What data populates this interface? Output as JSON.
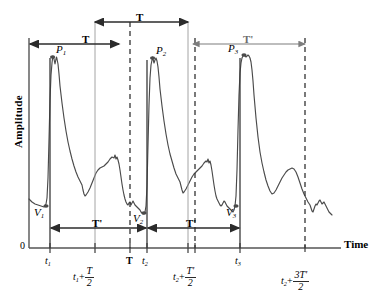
{
  "figure": {
    "type": "waveform-annotated-plot",
    "background": "#ffffff",
    "line_color": "#4a4a4a",
    "axis_color": "#5a5a5a",
    "annotation_color": "#2b2b2b"
  },
  "axes": {
    "y_label": "Amplitude",
    "x_label": "Time",
    "origin_label": "0"
  },
  "peaks": [
    {
      "name": "P1",
      "letter": "P",
      "index": "1"
    },
    {
      "name": "P2",
      "letter": "P",
      "index": "2"
    },
    {
      "name": "P3",
      "letter": "P",
      "index": "3"
    }
  ],
  "valleys": [
    {
      "name": "V1",
      "letter": "V",
      "index": "1"
    },
    {
      "name": "V2",
      "letter": "V",
      "index": "2"
    },
    {
      "name": "V3",
      "letter": "V",
      "index": "3"
    }
  ],
  "interval_labels": {
    "T": "T",
    "T_prime": "T'"
  },
  "brackets": [
    {
      "name": "top-T",
      "label": "T"
    },
    {
      "name": "upper-left-T",
      "label": "T"
    },
    {
      "name": "upper-right-T-prime",
      "label": "T'"
    },
    {
      "name": "lower-left-T-prime",
      "label": "T'"
    },
    {
      "name": "lower-right-T-prime",
      "label": "T'"
    }
  ],
  "x_ticks": [
    {
      "name": "t1",
      "letter": "t",
      "index": "1",
      "kind": "plain"
    },
    {
      "name": "t1-plus-T-over-2",
      "letter": "t",
      "index": "1",
      "op": "+",
      "num": "T",
      "den": "2",
      "kind": "fraction"
    },
    {
      "name": "T-tick",
      "label": "T",
      "kind": "bold"
    },
    {
      "name": "t2",
      "letter": "t",
      "index": "2",
      "kind": "plain"
    },
    {
      "name": "t2-plus-Tprime-over-2",
      "letter": "t",
      "index": "2",
      "op": "+",
      "num": "T'",
      "den": "2",
      "kind": "fraction"
    },
    {
      "name": "t3",
      "letter": "t",
      "index": "3",
      "kind": "plain"
    },
    {
      "name": "t2-plus-3Tprime-over-2",
      "letter": "t",
      "index": "2",
      "op": "+",
      "num": "3T'",
      "den": "2",
      "kind": "fraction"
    }
  ]
}
